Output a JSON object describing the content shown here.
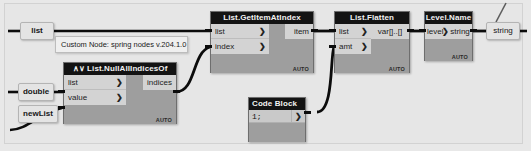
{
  "app": {
    "title": "Dynamo node graph",
    "canvas_bg": "#e6e6e6",
    "node_title_bg": "#131313",
    "node_body_bg": "#9e9e9e",
    "port_bg": "#d3d3d3",
    "wire_color": "#0c0c0c"
  },
  "inputs": [
    {
      "label": "list"
    },
    {
      "label": "double"
    },
    {
      "label": "newList"
    }
  ],
  "note": {
    "text": "Custom Node: spring nodes v.204.1.0"
  },
  "nodes": [
    {
      "id": "null-all-indices-of",
      "title": "∧∨ List.NullAllIndicesOf",
      "inputs": [
        {
          "label": "list",
          "chevron": "❯"
        },
        {
          "label": "value",
          "chevron": "❯"
        }
      ],
      "outputs": [
        {
          "label": "indices"
        }
      ],
      "badge": "AUTO"
    },
    {
      "id": "get-item-at-index",
      "title": "List.GetItemAtIndex",
      "inputs": [
        {
          "label": "list",
          "chevron": "❯"
        },
        {
          "label": "index",
          "chevron": "❯"
        }
      ],
      "outputs": [
        {
          "label": "item"
        }
      ],
      "badge": "AUTO"
    },
    {
      "id": "code-block",
      "title": "Code Block",
      "code": "1;",
      "output_chevron": "❯"
    },
    {
      "id": "list-flatten",
      "title": "List.Flatten",
      "inputs": [
        {
          "label": "list",
          "chevron": "❯"
        },
        {
          "label": "amt",
          "chevron": "❯"
        }
      ],
      "outputs": [
        {
          "label": "var[]..[]"
        }
      ],
      "badge": "AUTO"
    },
    {
      "id": "level-name",
      "title": "Level.Name",
      "inputs": [
        {
          "label": "level",
          "chevron": "❯"
        }
      ],
      "outputs": [
        {
          "label": "string"
        }
      ],
      "badge": "AUTO"
    }
  ],
  "outputs": [
    {
      "label": "string"
    }
  ]
}
